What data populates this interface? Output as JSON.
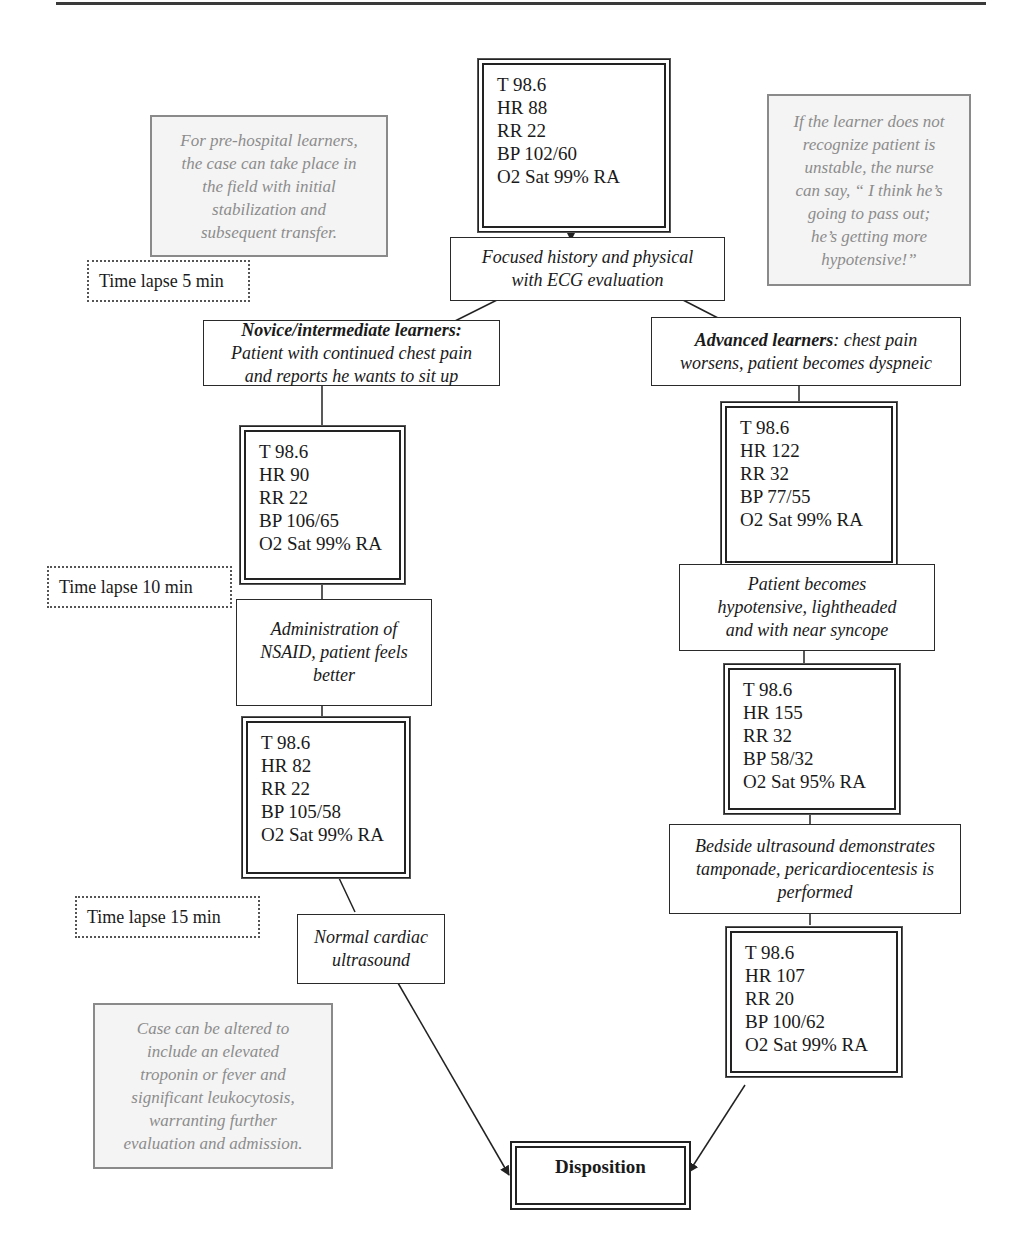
{
  "diagram": {
    "type": "clinical-simulation-flowchart",
    "start": {
      "vitals": [
        "T 98.6",
        "HR 88",
        "RR 22",
        "BP 102/60",
        "O2 Sat 99% RA"
      ]
    },
    "initial_step": {
      "lines": [
        "Focused history and physical",
        "with ECG evaluation"
      ]
    },
    "notes": {
      "prehospital": [
        "For pre-hospital learners,",
        "the case can take place in",
        "the field with initial",
        "stabilization and",
        "subsequent transfer."
      ],
      "nurse_prompt": [
        "If the learner does not",
        "recognize patient is",
        "unstable, the nurse",
        "can say, “ I think he’s",
        "going to pass out;",
        "he’s getting more",
        "hypotensive!”"
      ],
      "alteration": [
        "Case can be altered to",
        "include an elevated",
        "troponin or fever and",
        "significant leukocytosis,",
        "warranting further",
        "evaluation and admission."
      ]
    },
    "time_lapses": [
      "Time lapse 5 min",
      "Time lapse 10 min",
      "Time lapse 15 min"
    ],
    "novice_branch": {
      "header_bold": "Novice/intermediate learners:",
      "header_lines": [
        "Patient with continued chest pain",
        "and reports he wants to sit up"
      ],
      "vitals_1": [
        "T 98.6",
        "HR 90",
        "RR 22",
        "BP 106/65",
        "O2 Sat 99% RA"
      ],
      "step_1": [
        "Administration of",
        "NSAID, patient feels",
        "better"
      ],
      "vitals_2": [
        "T 98.6",
        "HR 82",
        "RR 22",
        "BP 105/58",
        "O2 Sat 99% RA"
      ],
      "step_2": [
        "Normal cardiac",
        "ultrasound"
      ]
    },
    "advanced_branch": {
      "header_bold": "Advanced learners",
      "header_rest_1": ": chest pain",
      "header_line_2": "worsens, patient becomes dyspneic",
      "vitals_1": [
        "T 98.6",
        "HR 122",
        "RR 32",
        "BP 77/55",
        "O2 Sat 99% RA"
      ],
      "step_1": [
        "Patient becomes",
        "hypotensive, lightheaded",
        "and with near syncope"
      ],
      "vitals_2": [
        "T 98.6",
        "HR 155",
        "RR 32",
        "BP 58/32",
        "O2 Sat 95% RA"
      ],
      "step_2": [
        "Bedside ultrasound demonstrates",
        "tamponade, pericardiocentesis is",
        "performed"
      ],
      "vitals_3": [
        "T 98.6",
        "HR 107",
        "RR 20",
        "BP 100/62",
        "O2 Sat 99% RA"
      ]
    },
    "end": {
      "label": "Disposition"
    },
    "colors": {
      "line": "#222222",
      "note_text": "#8c8c8c",
      "note_border": "#8a8a8a",
      "note_fill": "#f4f4f4"
    }
  }
}
